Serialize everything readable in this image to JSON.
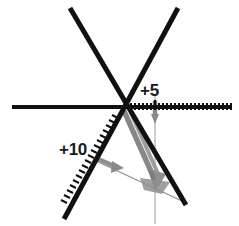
{
  "figure": {
    "width": 239,
    "height": 226,
    "background": "#ffffff"
  },
  "labels": {
    "right_scale": "+5",
    "left_scale": "+10"
  },
  "colors": {
    "axis": "#111111",
    "vector": "#808080",
    "vector_dark": "#6e6e6e",
    "thin_line": "#9a9a9a",
    "text": "#1a1a1a"
  },
  "geometry": {
    "origin": {
      "x": 123,
      "y": 108
    },
    "axes": [
      {
        "name": "horizontal-axis",
        "x1": 12,
        "y1": 107,
        "x2": 232,
        "y2": 107,
        "width": 4
      },
      {
        "name": "diagonal-axis-up-left",
        "x1": 70,
        "y1": 8,
        "x2": 186,
        "y2": 205,
        "width": 5
      },
      {
        "name": "diagonal-axis-up-right",
        "x1": 178,
        "y1": 8,
        "x2": 66,
        "y2": 218,
        "width": 5
      }
    ],
    "rulers": [
      {
        "name": "horizontal-ruler",
        "from": {
          "x": 130,
          "y": 107
        },
        "to": {
          "x": 231,
          "y": 107
        },
        "ticks": 26,
        "tick_length": 7,
        "label": "+5",
        "label_tick_index": 7
      },
      {
        "name": "diagonal-ruler",
        "from": {
          "x": 120,
          "y": 113
        },
        "to": {
          "x": 69,
          "y": 203
        },
        "ticks": 22,
        "tick_length": 7,
        "label": "+10"
      }
    ],
    "vectors": [
      {
        "name": "resultant-vector",
        "x1": 123,
        "y1": 110,
        "x2": 155,
        "y2": 182,
        "width": 5,
        "arrow": true
      },
      {
        "name": "component-vector-right",
        "x1": 130,
        "y1": 112,
        "x2": 158,
        "y2": 180,
        "width": 4,
        "arrow": true
      },
      {
        "name": "component-vector-down",
        "x1": 155,
        "y1": 105,
        "x2": 155,
        "y2": 124,
        "width": 4,
        "arrow": true
      },
      {
        "name": "component-vector-left",
        "x1": 97,
        "y1": 159,
        "x2": 119,
        "y2": 170,
        "width": 4,
        "arrow": true
      },
      {
        "name": "closing-line",
        "x1": 96,
        "y1": 161,
        "x2": 182,
        "y2": 201,
        "width": 1,
        "arrow": false
      }
    ],
    "reference_line": {
      "name": "vertical-reference-line",
      "x1": 155,
      "y1": 96,
      "x2": 155,
      "y2": 224,
      "width": 1
    }
  }
}
